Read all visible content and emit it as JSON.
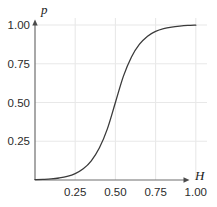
{
  "chart_data": {
    "type": "line",
    "title": "",
    "subtitle": "",
    "xlabel": "H",
    "ylabel": "p",
    "xlim": [
      0.0,
      1.05
    ],
    "ylim": [
      0.0,
      1.03
    ],
    "grid": true,
    "legend": null,
    "annotations": [],
    "xticks": [
      0.25,
      0.5,
      0.75,
      1.0
    ],
    "xticklabels": [
      "0.25",
      "0.50",
      "0.75",
      "1.00"
    ],
    "yticks": [
      0.25,
      0.5,
      0.75,
      1.0
    ],
    "yticklabels": [
      "0.25",
      "0.50",
      "0.75",
      "1.00"
    ],
    "series": [
      {
        "name": "p(H)",
        "color": "#3a3a3a",
        "linewidth": 1.3,
        "x": [
          0.0,
          0.05,
          0.1,
          0.15,
          0.2,
          0.25,
          0.3,
          0.35,
          0.4,
          0.45,
          0.5,
          0.55,
          0.6,
          0.65,
          0.7,
          0.75,
          0.8,
          0.85,
          0.9,
          0.95,
          1.0
        ],
        "y": [
          0.002,
          0.004,
          0.007,
          0.013,
          0.023,
          0.041,
          0.072,
          0.124,
          0.206,
          0.33,
          0.5,
          0.67,
          0.794,
          0.876,
          0.928,
          0.959,
          0.977,
          0.987,
          0.993,
          0.997,
          0.999
        ]
      }
    ]
  },
  "axes": {
    "y_axis_label": "p",
    "x_axis_label": "H",
    "y_tick_labels": [
      "1.00",
      "0.75",
      "0.50",
      "0.25"
    ],
    "x_tick_labels": [
      "0.25",
      "0.50",
      "0.75",
      "1.00"
    ]
  },
  "colors": {
    "curve": "#3a3a3a",
    "grid": "#e8e8e8",
    "axis": "#6e6e6e",
    "text": "#2b2b2b",
    "background": "#ffffff"
  }
}
